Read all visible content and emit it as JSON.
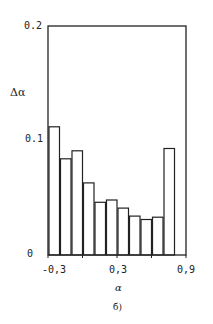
{
  "chart_data": {
    "type": "bar",
    "title": "",
    "xlabel": "α",
    "ylabel": "Δα",
    "panel_label": "б)",
    "xlim": [
      -0.3,
      0.9
    ],
    "ylim": [
      0,
      0.2
    ],
    "grid": false,
    "x_ticks": [
      "-0,3",
      "0,3",
      "0,9"
    ],
    "y_ticks": [
      "0",
      "0.1",
      "0.2"
    ],
    "bin_edges": [
      -0.3,
      -0.2,
      -0.1,
      0.0,
      0.1,
      0.2,
      0.3,
      0.4,
      0.5,
      0.6,
      0.7,
      0.8
    ],
    "categories": [
      "-0.3–-0.2",
      "-0.2–-0.1",
      "-0.1–0.0",
      "0.0–0.1",
      "0.1–0.2",
      "0.2–0.3",
      "0.3–0.4",
      "0.4–0.5",
      "0.5–0.6",
      "0.6–0.7",
      "0.7–0.8"
    ],
    "values": [
      0.112,
      0.084,
      0.091,
      0.063,
      0.046,
      0.048,
      0.041,
      0.034,
      0.031,
      0.033,
      0.093
    ]
  },
  "labels": {
    "y_top": "0.2",
    "y_mid": "0.1",
    "y_zero": "0",
    "y_axis": "Δα",
    "x_left": "-0,3",
    "x_mid": "0,3",
    "x_right": "0,9",
    "x_axis": "α",
    "panel": "б)"
  }
}
